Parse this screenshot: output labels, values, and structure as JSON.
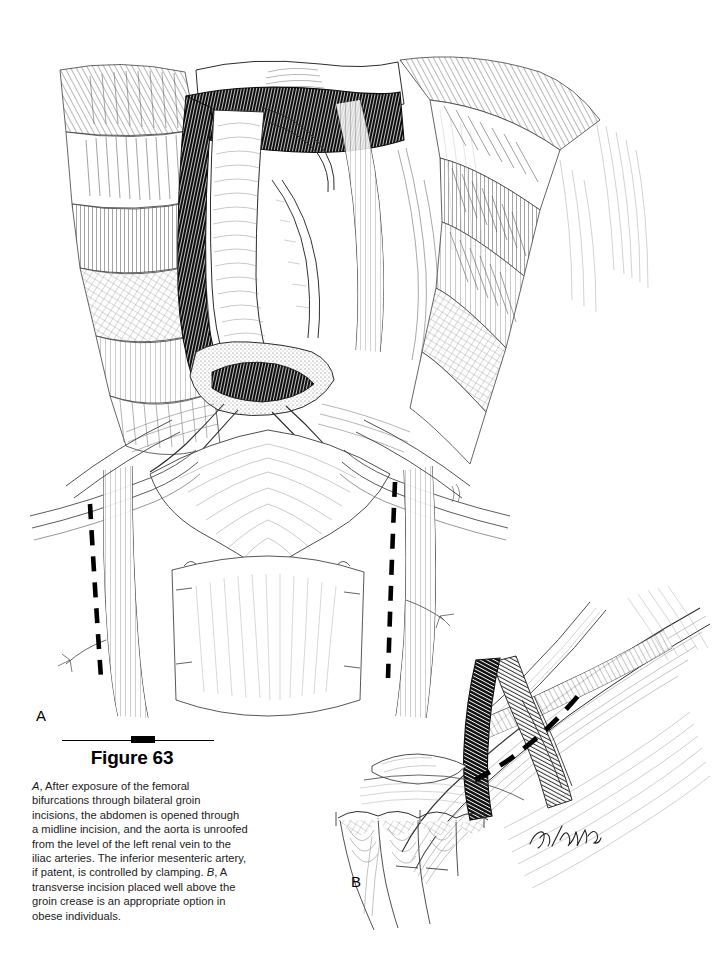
{
  "figure": {
    "number_label": "Figure 63",
    "panels": [
      {
        "letter": "A",
        "name": "panel-a"
      },
      {
        "letter": "B",
        "name": "panel-b"
      }
    ],
    "artist_signature": "JF/TMOL",
    "caption": {
      "panel_a_marker": "A",
      "panel_a_text": ", After exposure of the femoral bifurcations through bilateral groin incisions, the abdomen is opened through a midline incision, and the aorta is unroofed from the level of the left renal vein to the iliac arteries. The inferior mesenteric artery, if patent, is controlled by clamping. ",
      "panel_b_marker": "B",
      "panel_b_text": ", A transverse incision placed well above the groin crease is an appropriate option in obese individuals."
    }
  },
  "colors": {
    "ink": "#000000",
    "paper": "#ffffff",
    "caption_text": "#1b1b1b",
    "line_light": "#555555",
    "line_mid": "#333333"
  },
  "illustration": {
    "type": "pen-and-ink surgical illustration",
    "panel_a": {
      "description": "Abdominal midline exposure with unroofed aorta extending from the left renal vein to the iliac arteries, bilateral femoral bifurcations exposed, retracted abdominal wall flaps with cross-hatched fascia and hatched muscle",
      "structures": [
        "aorta",
        "left renal vein",
        "inferior mesenteric artery",
        "common iliac arteries",
        "external iliac arteries",
        "inferior vena cava",
        "retroperitoneal tissue",
        "abdominal wall retraction flaps",
        "pubic region"
      ],
      "incision_markings": [
        {
          "name": "left-groin-incision-dashed-line",
          "orientation": "oblique-vertical"
        },
        {
          "name": "right-groin-incision-dashed-line",
          "orientation": "oblique-vertical"
        }
      ]
    },
    "panel_b": {
      "description": "Close-up of the groin with femoral artery and vein crossed by a dashed transverse incision line placed well above the groin crease, with skin and fascial edges retracted below",
      "structures": [
        "femoral artery",
        "femoral vein",
        "inguinal ligament",
        "skin edge",
        "fascia lata",
        "retracted tissue flaps"
      ],
      "incision_markings": [
        {
          "name": "transverse-incision-dashed-line",
          "orientation": "transverse-oblique"
        }
      ]
    }
  }
}
